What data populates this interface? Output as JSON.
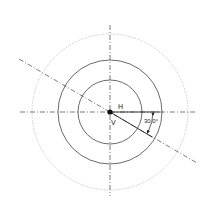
{
  "diagram": {
    "labels": {
      "horizontal": "H",
      "vertical": "V",
      "angle": "30.0°"
    },
    "angle_deg": 30.0,
    "colors": {
      "line": "#333333",
      "dotted": "#999999"
    }
  }
}
